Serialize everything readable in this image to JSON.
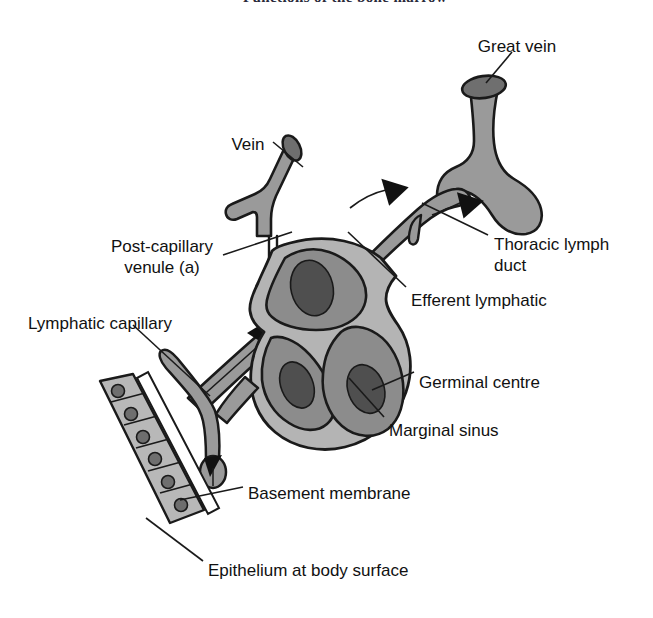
{
  "page": {
    "header_text": "Functions of the bone marrow",
    "background": "#ffffff",
    "width": 653,
    "height": 618
  },
  "figure": {
    "colors": {
      "vessel_fill": "#9a9a9a",
      "node_cortex": "#8c8c8c",
      "node_rim": "#b4b4b4",
      "germinal_centre": "#4f4f4f",
      "epithelium_fill": "#b8b8b8",
      "nucleus_fill": "#6e6e6e",
      "outline": "#1a1a1a",
      "leader_line": "#1a1a1a",
      "text": "#111111"
    },
    "labels": [
      {
        "id": "great-vein",
        "text": "Great vein",
        "x": 517,
        "y": 36,
        "align": "center",
        "leader": "from text down-left to vessel opening"
      },
      {
        "id": "vein",
        "text": "Vein",
        "x": 248,
        "y": 134,
        "align": "center",
        "leader": "from text right-down to vein tube"
      },
      {
        "id": "post-capillary-venule",
        "text": "Post-capillary\nvenule (a)",
        "x": 162,
        "y": 236,
        "align": "center",
        "leader": "from text right-up to venule inside node"
      },
      {
        "id": "thoracic-lymph-duct",
        "text": "Thoracic lymph\nduct",
        "x": 494,
        "y": 234,
        "align": "left",
        "leader": "from text up-left to duct valve"
      },
      {
        "id": "efferent-lymphatic",
        "text": "Efferent lymphatic",
        "x": 411,
        "y": 290,
        "align": "left",
        "leader": "from text up-left to efferent vessel"
      },
      {
        "id": "lymphatic-capillary",
        "text": "Lymphatic capillary",
        "x": 28,
        "y": 313,
        "align": "left",
        "leader": "from text down-right to capillary branch"
      },
      {
        "id": "germinal-centre",
        "text": "Germinal centre",
        "x": 419,
        "y": 372,
        "align": "left",
        "leader": "from text up-left to dark germinal centre"
      },
      {
        "id": "marginal-sinus",
        "text": "Marginal sinus",
        "x": 389,
        "y": 420,
        "align": "left",
        "leader": "from text up-left to node rim"
      },
      {
        "id": "basement-membrane",
        "text": "Basement membrane",
        "x": 248,
        "y": 483,
        "align": "left",
        "leader": "from text left to membrane line"
      },
      {
        "id": "epithelium-at-body-surface",
        "text": "Epithelium at body surface",
        "x": 208,
        "y": 560,
        "align": "left",
        "leader": "from text up-left to epithelial cell sheet"
      }
    ],
    "structures": [
      {
        "id": "great-vein-tube",
        "name": "Great vein",
        "note": "thick vertical vessel with elliptical cut opening at top"
      },
      {
        "id": "thoracic-duct-vessel",
        "name": "Thoracic lymph duct",
        "note": "vessel running up-right into great vein, with valve notch"
      },
      {
        "id": "efferent-lymphatic-vessel",
        "name": "Efferent lymphatic",
        "note": "vessel leaving node top-right, flow arrow toward great vein"
      },
      {
        "id": "vein-tube",
        "name": "Vein",
        "note": "short oblique tube with elliptical cut end, upper left of node"
      },
      {
        "id": "post-capillary-venule-vessel",
        "name": "Post-capillary venule (a)",
        "note": "narrow vessel descending into node"
      },
      {
        "id": "lymph-node",
        "name": "Lymph node",
        "note": "kidney/ovoid node with marginal sinus rim and three lobules"
      },
      {
        "id": "germinal-centre-1",
        "name": "Germinal centre",
        "note": "dark ellipse in upper lobule"
      },
      {
        "id": "germinal-centre-2",
        "name": "Germinal centre",
        "note": "dark ellipse in lower-left lobule"
      },
      {
        "id": "germinal-centre-3",
        "name": "Germinal centre",
        "note": "dark ellipse in lower-right lobule"
      },
      {
        "id": "afferent-lymphatic-vessel",
        "name": "Afferent lymphatic",
        "note": "vessel entering node lower-left with flow arrow"
      },
      {
        "id": "lymphatic-capillary-vessel",
        "name": "Lymphatic capillary",
        "note": "Y-shaped blind-ended capillary at body surface"
      },
      {
        "id": "basement-membrane-line",
        "name": "Basement membrane",
        "note": "thin double line beneath epithelium"
      },
      {
        "id": "epithelium-sheet",
        "name": "Epithelium at body surface",
        "note": "row of six columnar cells each with a nucleus"
      }
    ],
    "flow_arrows": [
      {
        "id": "arrow-capillary-to-node",
        "direction": "up-right",
        "note": "lymph entering node"
      },
      {
        "id": "arrow-node-to-duct",
        "direction": "up-right",
        "note": "lymph leaving node"
      },
      {
        "id": "arrow-duct-to-vein",
        "direction": "up-right",
        "note": "lymph entering great vein"
      },
      {
        "id": "arrow-into-capillary",
        "direction": "up",
        "note": "tissue fluid entering blind capillary"
      }
    ]
  }
}
